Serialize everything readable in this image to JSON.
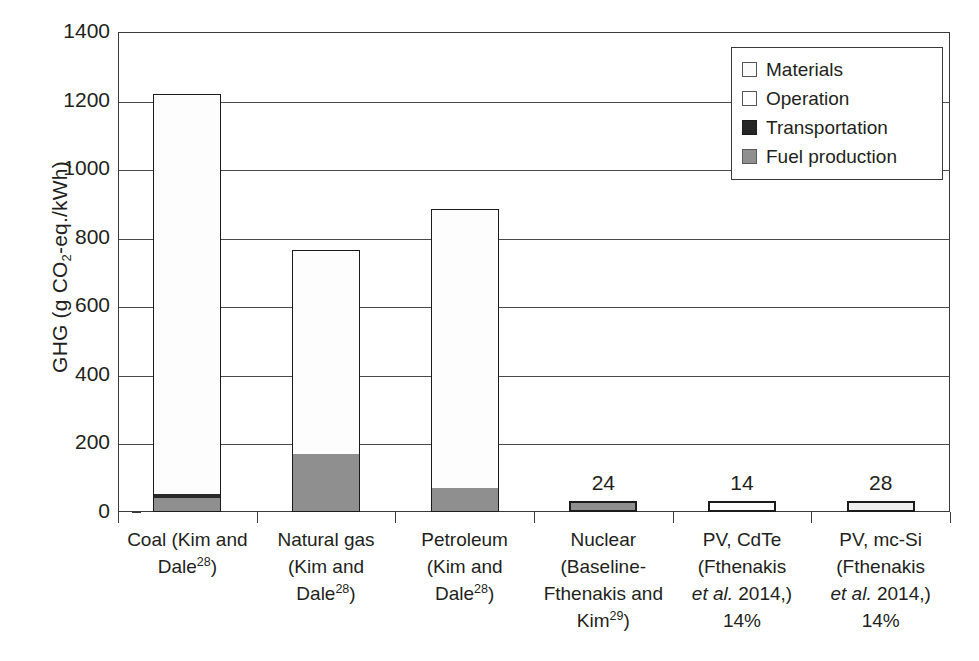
{
  "chart_data": {
    "type": "bar",
    "subtype": "stacked-bar",
    "title": "",
    "xlabel": "",
    "ylabel": "GHG (g CO2-eq./kWh)",
    "ylabel_parts": {
      "prefix": "GHG (g CO",
      "sub": "2",
      "suffix": "-eq./kWh)"
    },
    "ylim": [
      0,
      1400
    ],
    "ytick_step": 200,
    "ytick_labels": [
      "1400",
      "1200",
      "1000",
      "800",
      "600",
      "400",
      "200",
      "0"
    ],
    "grid": "horizontal",
    "legend_position": "top-right",
    "categories": [
      "Coal (Kim and Dale28)",
      "Natural gas (Kim and Dale28)",
      "Petroleum (Kim and Dale28)",
      "Nuclear (Baseline-Fthenakis and Kim29)",
      "PV, CdTe (Fthenakis et al. 2014,) 14%",
      "PV, mc-Si (Fthenakis et al. 2014,) 14%"
    ],
    "series": [
      {
        "name": "Fuel production",
        "color": "#8f8f8f",
        "values": [
          40,
          168,
          70,
          24,
          0,
          0
        ]
      },
      {
        "name": "Transportation",
        "color": "#2a2a2a",
        "values": [
          8,
          0,
          0,
          0,
          0,
          0
        ]
      },
      {
        "name": "Operation",
        "color": "#fdfdfd",
        "values": [
          1167,
          595,
          814,
          0,
          14,
          28
        ]
      },
      {
        "name": "Materials",
        "color": "#fbfbfb",
        "values": [
          0,
          0,
          0,
          0,
          0,
          0
        ]
      }
    ],
    "totals": [
      1215,
      763,
      884,
      24,
      14,
      28
    ],
    "data_labels": [
      "",
      "",
      "",
      "24",
      "14",
      "28"
    ]
  },
  "legend": {
    "items": [
      {
        "label": "Materials",
        "swatch": "materials-swatch"
      },
      {
        "label": "Operation",
        "swatch": "operation-swatch"
      },
      {
        "label": "Transportation",
        "swatch": "transportation-swatch"
      },
      {
        "label": "Fuel production",
        "swatch": "fuel-production-swatch"
      }
    ]
  },
  "yaxis": {
    "ticks": [
      {
        "label": "1400",
        "value": 1400
      },
      {
        "label": "1200",
        "value": 1200
      },
      {
        "label": "1000",
        "value": 1000
      },
      {
        "label": "800",
        "value": 800
      },
      {
        "label": "600",
        "value": 600
      },
      {
        "label": "400",
        "value": 400
      },
      {
        "label": "200",
        "value": 200
      },
      {
        "label": "0",
        "value": 0
      }
    ]
  },
  "xaxis": {
    "labels": [
      {
        "lines": [
          {
            "text": "Coal (Kim and",
            "sup": "",
            "tail": ""
          },
          {
            "text": "Dale",
            "sup": "28",
            "tail": ")"
          }
        ]
      },
      {
        "lines": [
          {
            "text": "Natural gas",
            "sup": "",
            "tail": ""
          },
          {
            "text": "(Kim and",
            "sup": "",
            "tail": ""
          },
          {
            "text": "Dale",
            "sup": "28",
            "tail": ")"
          }
        ]
      },
      {
        "lines": [
          {
            "text": "Petroleum",
            "sup": "",
            "tail": ""
          },
          {
            "text": "(Kim and",
            "sup": "",
            "tail": ""
          },
          {
            "text": "Dale",
            "sup": "28",
            "tail": ")"
          }
        ]
      },
      {
        "lines": [
          {
            "text": "Nuclear",
            "sup": "",
            "tail": ""
          },
          {
            "text": "(Baseline-",
            "sup": "",
            "tail": ""
          },
          {
            "text": "Fthenakis and",
            "sup": "",
            "tail": ""
          },
          {
            "text": "Kim",
            "sup": "29",
            "tail": ")"
          }
        ]
      },
      {
        "lines": [
          {
            "text": "PV, CdTe",
            "sup": "",
            "tail": ""
          },
          {
            "text": "(Fthenakis",
            "sup": "",
            "tail": ""
          },
          {
            "text": "et al.",
            "italic": true,
            "tail2": " 2014,)"
          },
          {
            "text": "14%",
            "sup": "",
            "tail": ""
          }
        ]
      },
      {
        "lines": [
          {
            "text": "PV, mc-Si",
            "sup": "",
            "tail": ""
          },
          {
            "text": "(Fthenakis",
            "sup": "",
            "tail": ""
          },
          {
            "text": "et al.",
            "italic": true,
            "tail2": " 2014,)"
          },
          {
            "text": "14%",
            "sup": "",
            "tail": ""
          }
        ]
      }
    ]
  },
  "bar_values": {
    "nuclear": "24",
    "pv_cdte": "14",
    "pv_mcsi": "28"
  }
}
